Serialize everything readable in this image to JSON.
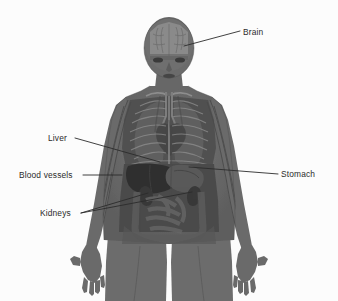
{
  "figure": {
    "background_color": "#fcfcfc",
    "body_color": "#6a6a6a",
    "organ_color": "#4a4a4a",
    "line_color": "#2b2b2b",
    "text_color": "#2b2b2b"
  },
  "labels": {
    "brain": "Brain",
    "liver": "Liver",
    "blood_vessels": "Blood vessels",
    "kidneys": "Kidneys",
    "stomach": "Stomach"
  },
  "body_parts": {
    "head": "head",
    "brain": "brain",
    "eye_left": "left eye",
    "eye_right": "right eye",
    "nose": "nose",
    "mouth": "mouth",
    "neck": "neck",
    "torso": "torso",
    "left_arm": "left arm",
    "right_arm": "right arm",
    "left_hand": "left hand",
    "right_hand": "right hand",
    "left_leg": "left leg",
    "right_leg": "right leg",
    "ribcage": "ribcage",
    "lung_left": "left lung",
    "lung_right": "right lung",
    "heart": "heart",
    "liver": "liver",
    "stomach": "stomach",
    "kidney_left": "left kidney",
    "kidney_right": "right kidney",
    "intestines": "intestines",
    "vessels": "blood vessels"
  }
}
